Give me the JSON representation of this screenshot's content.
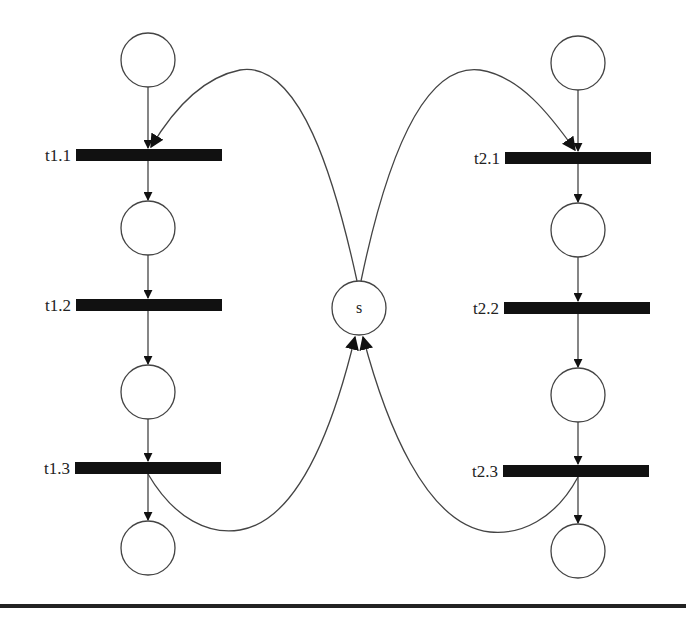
{
  "diagram": {
    "type": "petri-net",
    "shared_place": {
      "label": "s",
      "cx": 359,
      "cy": 308,
      "r": 27
    },
    "process_1": {
      "column_x": 148,
      "places": [
        {
          "cy": 60
        },
        {
          "cy": 228
        },
        {
          "cy": 392
        },
        {
          "cy": 548
        }
      ],
      "transitions": [
        {
          "label": "t1.1",
          "y": 155
        },
        {
          "label": "t1.2",
          "y": 305
        },
        {
          "label": "t1.3",
          "y": 468
        }
      ]
    },
    "process_2": {
      "column_x": 578,
      "places": [
        {
          "cy": 63
        },
        {
          "cy": 230
        },
        {
          "cy": 395
        },
        {
          "cy": 551
        }
      ],
      "transitions": [
        {
          "label": "t2.1",
          "y": 158
        },
        {
          "label": "t2.2",
          "y": 308
        },
        {
          "label": "t2.3",
          "y": 471
        }
      ]
    },
    "arcs": [
      "s -> t1.1",
      "s -> t2.1",
      "t1.3 -> s",
      "t2.3 -> s"
    ],
    "colors": {
      "stroke": "#333333",
      "transition_fill": "#111111",
      "background": "#ffffff"
    }
  }
}
